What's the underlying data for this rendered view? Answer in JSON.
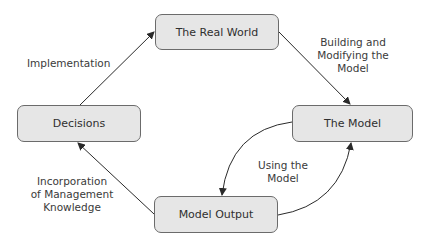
{
  "diagram": {
    "nodes": {
      "real_world": "The Real World",
      "model": "The Model",
      "decisions": "Decisions",
      "model_output": "Model Output"
    },
    "edges": {
      "implementation": "Implementation",
      "building": [
        "Building and",
        "Modifying the",
        "Model"
      ],
      "using": [
        "Using the",
        "Model"
      ],
      "incorporation": [
        "Incorporation",
        "of Management",
        "Knowledge"
      ]
    },
    "colors": {
      "node_fill": "#e6e6e6",
      "node_border": "#6b6b6b",
      "arrow": "#2a2a2a"
    }
  }
}
